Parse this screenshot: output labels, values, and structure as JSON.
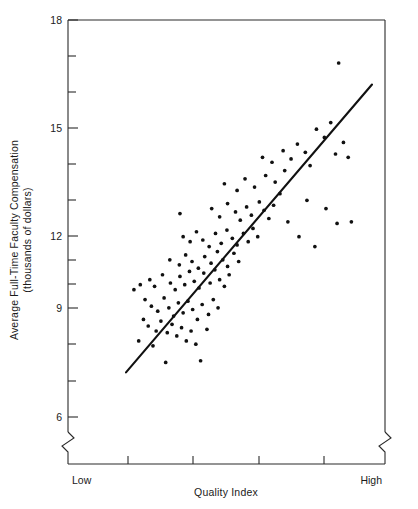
{
  "chart_data": {
    "type": "scatter",
    "title": "",
    "xlabel": "Quality Index",
    "ylabel": "Average Full-Time Faculty Compensation\n(thousands of dollars)",
    "ylabel_line1": "Average Full-Time Faculty Compensation",
    "ylabel_line2": "(thousands of dollars)",
    "y_ticklabels": [
      "18",
      "15",
      "12",
      "9",
      "6"
    ],
    "y_tickvalues": [
      18,
      15,
      12,
      9,
      6
    ],
    "y_minor_tickvalues": [
      17,
      16,
      14,
      13,
      11,
      10,
      8,
      7
    ],
    "ylim": [
      6,
      18
    ],
    "y_axis_break": true,
    "x_endpoint_labels": [
      "Low",
      "High"
    ],
    "x_tick_count": 4,
    "x_ticks_unlabeled": true,
    "xlim": [
      0,
      100
    ],
    "grid": false,
    "legend": false,
    "point_color": "#111111",
    "line_color": "#111111",
    "fit_line": {
      "description": "least-squares regression line",
      "x_start": 18.0,
      "y_start": 7.35,
      "x_end": 95.5,
      "y_end": 16.05
    },
    "n_points": 115,
    "points": [
      [
        22.0,
        8.3
      ],
      [
        26.5,
        8.15
      ],
      [
        30.5,
        7.65
      ],
      [
        41.5,
        7.7
      ],
      [
        23.5,
        8.95
      ],
      [
        25.0,
        8.75
      ],
      [
        27.5,
        8.6
      ],
      [
        29.0,
        8.9
      ],
      [
        31.0,
        8.55
      ],
      [
        32.5,
        8.8
      ],
      [
        34.0,
        8.45
      ],
      [
        35.5,
        8.7
      ],
      [
        37.0,
        8.3
      ],
      [
        38.5,
        8.6
      ],
      [
        40.0,
        8.2
      ],
      [
        43.5,
        8.65
      ],
      [
        24.0,
        9.55
      ],
      [
        26.0,
        9.35
      ],
      [
        28.0,
        9.2
      ],
      [
        30.0,
        9.6
      ],
      [
        31.5,
        9.3
      ],
      [
        33.0,
        9.05
      ],
      [
        34.5,
        9.45
      ],
      [
        36.0,
        9.15
      ],
      [
        37.5,
        9.5
      ],
      [
        39.0,
        9.25
      ],
      [
        40.5,
        8.95
      ],
      [
        42.0,
        9.4
      ],
      [
        44.0,
        9.1
      ],
      [
        45.5,
        9.55
      ],
      [
        47.0,
        9.3
      ],
      [
        25.5,
        10.15
      ],
      [
        27.0,
        9.95
      ],
      [
        29.5,
        10.3
      ],
      [
        32.0,
        10.05
      ],
      [
        33.5,
        9.85
      ],
      [
        35.0,
        10.25
      ],
      [
        36.5,
        10.0
      ],
      [
        38.0,
        10.4
      ],
      [
        39.5,
        10.1
      ],
      [
        41.0,
        9.9
      ],
      [
        42.5,
        10.35
      ],
      [
        44.5,
        10.05
      ],
      [
        46.0,
        10.45
      ],
      [
        47.5,
        10.15
      ],
      [
        49.0,
        9.95
      ],
      [
        50.5,
        10.3
      ],
      [
        20.5,
        9.85
      ],
      [
        22.5,
        10.0
      ],
      [
        31.8,
        10.75
      ],
      [
        34.8,
        10.6
      ],
      [
        36.8,
        10.9
      ],
      [
        38.8,
        10.7
      ],
      [
        40.8,
        10.5
      ],
      [
        42.8,
        10.85
      ],
      [
        44.8,
        10.65
      ],
      [
        46.8,
        11.0
      ],
      [
        48.5,
        10.75
      ],
      [
        50.0,
        10.55
      ],
      [
        52.0,
        10.95
      ],
      [
        53.5,
        10.7
      ],
      [
        36.0,
        11.45
      ],
      [
        38.2,
        11.3
      ],
      [
        40.2,
        11.6
      ],
      [
        42.2,
        11.35
      ],
      [
        44.2,
        11.15
      ],
      [
        46.2,
        11.55
      ],
      [
        48.0,
        11.25
      ],
      [
        49.8,
        11.65
      ],
      [
        51.5,
        11.4
      ],
      [
        53.0,
        11.2
      ],
      [
        55.0,
        11.55
      ],
      [
        56.5,
        11.3
      ],
      [
        58.0,
        11.7
      ],
      [
        59.5,
        11.45
      ],
      [
        35.0,
        12.15
      ],
      [
        45.0,
        12.3
      ],
      [
        47.5,
        12.05
      ],
      [
        50.0,
        12.45
      ],
      [
        52.5,
        12.2
      ],
      [
        54.0,
        11.95
      ],
      [
        56.0,
        12.35
      ],
      [
        57.5,
        12.1
      ],
      [
        60.0,
        12.5
      ],
      [
        61.5,
        12.25
      ],
      [
        63.0,
        12.0
      ],
      [
        64.5,
        12.4
      ],
      [
        49.0,
        13.05
      ],
      [
        53.0,
        12.85
      ],
      [
        55.5,
        13.2
      ],
      [
        58.5,
        12.95
      ],
      [
        62.0,
        13.3
      ],
      [
        65.0,
        13.1
      ],
      [
        66.5,
        12.75
      ],
      [
        68.0,
        13.45
      ],
      [
        61.0,
        13.85
      ],
      [
        64.0,
        13.7
      ],
      [
        67.5,
        14.05
      ],
      [
        70.0,
        13.8
      ],
      [
        72.0,
        14.25
      ],
      [
        74.5,
        14.0
      ],
      [
        76.0,
        13.6
      ],
      [
        78.0,
        14.7
      ],
      [
        80.5,
        14.45
      ],
      [
        82.5,
        14.9
      ],
      [
        84.0,
        13.95
      ],
      [
        86.5,
        14.3
      ],
      [
        88.0,
        13.85
      ],
      [
        69.0,
        11.9
      ],
      [
        72.5,
        11.45
      ],
      [
        75.0,
        12.55
      ],
      [
        77.5,
        11.15
      ],
      [
        81.0,
        12.3
      ],
      [
        84.5,
        11.85
      ],
      [
        89.0,
        11.9
      ],
      [
        85.0,
        16.7
      ]
    ]
  }
}
